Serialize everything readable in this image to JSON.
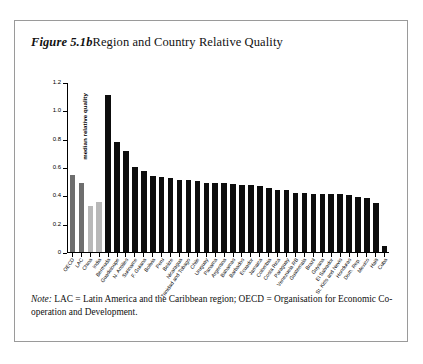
{
  "figure": {
    "number": "Figure 5.1b",
    "title": "Region and Country Relative Quality",
    "note_label": "Note:",
    "note_text": " LAC = Latin America and the Caribbean region; OECD = Organisation for Economic Co-operation and Development."
  },
  "colors": {
    "bar_black": "#0d0d0d",
    "bar_dark_gray": "#6e6e6e",
    "bar_light_gray": "#b8b8b8",
    "axis": "#000000",
    "panel_border": "#9a9a9a",
    "background": "#ffffff"
  },
  "chart_data": {
    "type": "bar",
    "title": "Region and Country Relative Quality",
    "xlabel": "",
    "ylabel": "median relative quality",
    "ylim": [
      0,
      1.2
    ],
    "yticks": [
      "0",
      "0.2",
      "0.4",
      "0.6",
      "0.8",
      "1.0",
      "1.2"
    ],
    "ytick_values": [
      0,
      0.2,
      0.4,
      0.6,
      0.8,
      1.0,
      1.2
    ],
    "grid": false,
    "legend": "none",
    "categories": [
      "OECD",
      "LAC",
      "China",
      "India",
      "Bermuda",
      "Guadeloupe",
      "N. Antilles",
      "Suriname",
      "F. Guiana",
      "Bolivia",
      "Peru",
      "Belize",
      "Nicaragua",
      "Trinidad and Tobago",
      "Chile",
      "Uruguay",
      "Panama",
      "Argentina",
      "Bahamas",
      "Barbados",
      "Ecuador",
      "Jamaica",
      "Colombia",
      "Costa Rica",
      "Paraguay",
      "Venezuela RB",
      "Guatemala",
      "Brazil",
      "Guyana",
      "El Salvador",
      "St. Kitts and Nevis",
      "Honduras",
      "Dom. Rep.",
      "Mexico",
      "Haiti",
      "Cuba"
    ],
    "values": [
      0.545,
      0.49,
      0.325,
      0.35,
      1.105,
      0.775,
      0.71,
      0.6,
      0.575,
      0.535,
      0.53,
      0.52,
      0.51,
      0.505,
      0.5,
      0.49,
      0.485,
      0.485,
      0.48,
      0.475,
      0.47,
      0.465,
      0.45,
      0.44,
      0.435,
      0.42,
      0.415,
      0.41,
      0.41,
      0.41,
      0.41,
      0.405,
      0.39,
      0.38,
      0.345,
      0.045
    ],
    "bar_colors": [
      "#6e6e6e",
      "#6e6e6e",
      "#b8b8b8",
      "#b8b8b8",
      "#0d0d0d",
      "#0d0d0d",
      "#0d0d0d",
      "#0d0d0d",
      "#0d0d0d",
      "#0d0d0d",
      "#0d0d0d",
      "#0d0d0d",
      "#0d0d0d",
      "#0d0d0d",
      "#0d0d0d",
      "#0d0d0d",
      "#0d0d0d",
      "#0d0d0d",
      "#0d0d0d",
      "#0d0d0d",
      "#0d0d0d",
      "#0d0d0d",
      "#0d0d0d",
      "#0d0d0d",
      "#0d0d0d",
      "#0d0d0d",
      "#0d0d0d",
      "#0d0d0d",
      "#0d0d0d",
      "#0d0d0d",
      "#0d0d0d",
      "#0d0d0d",
      "#0d0d0d",
      "#0d0d0d",
      "#0d0d0d",
      "#0d0d0d"
    ]
  }
}
